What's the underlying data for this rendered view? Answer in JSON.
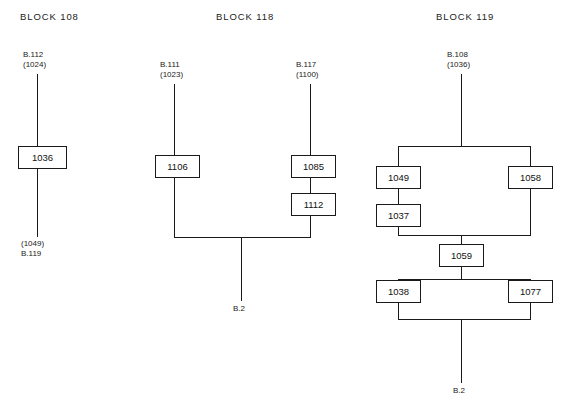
{
  "diagram": {
    "blocks": [
      {
        "id": "block-108",
        "title": "BLOCK  108",
        "input_label": {
          "line1": "B.112",
          "line2": "(1024)"
        },
        "output_label": {
          "line1": "(1049)",
          "line2": "B.119"
        },
        "nodes": [
          {
            "id": "n1036",
            "label": "1036"
          }
        ]
      },
      {
        "id": "block-118",
        "title": "BLOCK  118",
        "input_label_left": {
          "line1": "B.111",
          "line2": "(1023)"
        },
        "input_label_right": {
          "line1": "B.117",
          "line2": "(1100)"
        },
        "output_label": {
          "line1": "B.2"
        },
        "nodes": [
          {
            "id": "n1106",
            "label": "1106"
          },
          {
            "id": "n1085",
            "label": "1085"
          },
          {
            "id": "n1112",
            "label": "1112"
          }
        ]
      },
      {
        "id": "block-119",
        "title": "BLOCK  119",
        "input_label": {
          "line1": "B.108",
          "line2": "(1036)"
        },
        "output_label": {
          "line1": "B.2"
        },
        "nodes": [
          {
            "id": "n1049",
            "label": "1049"
          },
          {
            "id": "n1058",
            "label": "1058"
          },
          {
            "id": "n1037",
            "label": "1037"
          },
          {
            "id": "n1059",
            "label": "1059"
          },
          {
            "id": "n1038",
            "label": "1038"
          },
          {
            "id": "n1077",
            "label": "1077"
          }
        ]
      }
    ]
  }
}
